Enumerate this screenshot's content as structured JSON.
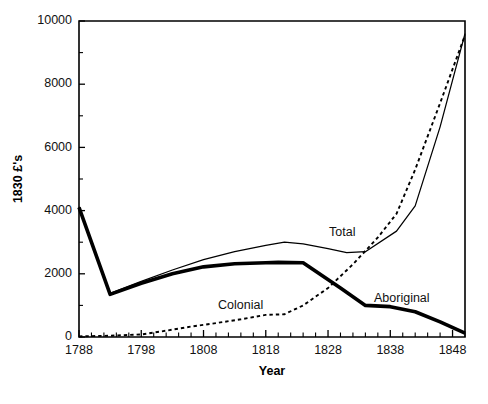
{
  "figure": {
    "caption": ""
  },
  "axes": {
    "xlabel": "Year",
    "ylabel": "1830  £'s",
    "x_ticks": [
      "1788",
      "1798",
      "1808",
      "1818",
      "1828",
      "1838",
      "1848"
    ],
    "y_ticks": [
      "0",
      "2000",
      "4000",
      "6000",
      "8000",
      "10000"
    ]
  },
  "labels": {
    "total": "Total",
    "colonial": "Colonial",
    "aboriginal": "Aboriginal"
  },
  "colors": {
    "ink": "#000000",
    "background": "#ffffff"
  },
  "chart_data": {
    "type": "line",
    "title": "",
    "xlabel": "Year",
    "ylabel": "1830 £'s",
    "xlim": [
      1788,
      1850
    ],
    "ylim": [
      0,
      10000
    ],
    "xticks": [
      1788,
      1798,
      1808,
      1818,
      1828,
      1838,
      1848
    ],
    "yticks": [
      0,
      2000,
      4000,
      6000,
      8000,
      10000
    ],
    "x_minor_tick_step": 2,
    "y_minor_tick_step": 1000,
    "grid": false,
    "legend": "inline-annotations",
    "series": [
      {
        "name": "Aboriginal",
        "style": "thick-solid",
        "x": [
          1788,
          1793,
          1798,
          1803,
          1808,
          1813,
          1818,
          1820,
          1824,
          1830,
          1834,
          1838,
          1842,
          1846,
          1850
        ],
        "values": [
          4100,
          1350,
          1700,
          2000,
          2220,
          2320,
          2350,
          2360,
          2350,
          1550,
          1000,
          960,
          800,
          480,
          120
        ]
      },
      {
        "name": "Colonial",
        "style": "dotted",
        "x": [
          1788,
          1793,
          1798,
          1802,
          1806,
          1810,
          1814,
          1818,
          1821,
          1824,
          1828,
          1832,
          1836,
          1839,
          1842,
          1846,
          1850
        ],
        "values": [
          20,
          40,
          80,
          200,
          330,
          440,
          560,
          700,
          720,
          1000,
          1550,
          2300,
          3150,
          3900,
          5300,
          7400,
          9550
        ]
      },
      {
        "name": "Total",
        "style": "thin-solid",
        "x": [
          1788,
          1793,
          1798,
          1803,
          1808,
          1813,
          1818,
          1821,
          1824,
          1828,
          1831,
          1834,
          1839,
          1842,
          1846,
          1850
        ],
        "values": [
          4120,
          1380,
          1760,
          2120,
          2450,
          2700,
          2900,
          3000,
          2950,
          2800,
          2670,
          2700,
          3350,
          4150,
          6650,
          9600
        ]
      }
    ]
  }
}
